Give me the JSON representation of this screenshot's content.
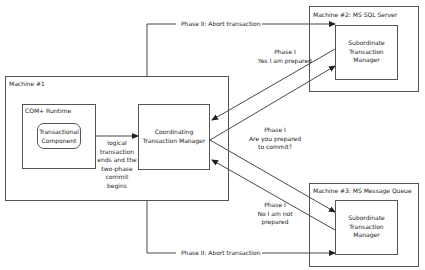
{
  "machine1": {
    "title": "Machine #1",
    "com_runtime": {
      "title": "COM+ Runtime",
      "component": [
        "Transactional",
        "Component"
      ]
    },
    "coordinator": [
      "Coordinating",
      "Transaction Manager"
    ],
    "handoff_label": [
      "logical",
      "transaction",
      "ends and the",
      "two-phase",
      "commit",
      "begins"
    ]
  },
  "machine2": {
    "title": "Machine #2: MS SQL Server",
    "subordinate": [
      "Subordinate",
      "Transaction",
      "Manager"
    ]
  },
  "machine3": {
    "title": "Machine #3: MS Message Queue",
    "subordinate": [
      "Subordinate",
      "Transaction",
      "Manager"
    ]
  },
  "messages": {
    "phase2_top": "Phase II: Abort transaction",
    "phase2_bottom": "Phase II: Abort transaction",
    "phase1_yes": [
      "Phase I",
      "Yes I am prepared"
    ],
    "phase1_ask": [
      "Phase I",
      "Are you prepared",
      "to commit?"
    ],
    "phase1_no": [
      "Phase I",
      "No I am not",
      "prepared"
    ]
  },
  "colors": {
    "line": "#333333",
    "box_border": "#555555",
    "background": "#ffffff"
  }
}
